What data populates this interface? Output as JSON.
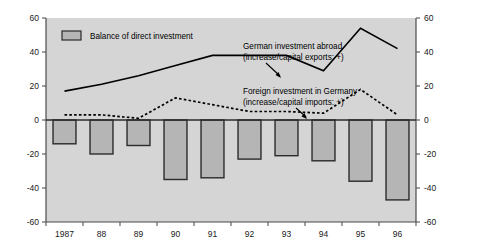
{
  "chart_data": {
    "type": "bar",
    "title": "",
    "subtitle": "",
    "xlabel": "",
    "ylabel": "",
    "ylim": [
      -60,
      60
    ],
    "y_ticks": [
      60,
      40,
      20,
      0,
      -20,
      -40,
      -60
    ],
    "y_tick_labels": [
      "60",
      "40",
      "20",
      "0",
      "-20",
      "-40",
      "-60"
    ],
    "right_axis": true,
    "right_y_tick_labels": [
      "60",
      "40",
      "20",
      "0",
      "-20",
      "-40",
      "-60"
    ],
    "grid": false,
    "legend_position": "inside-top-left",
    "categories": [
      "1987",
      "88",
      "89",
      "90",
      "91",
      "92",
      "93",
      "94",
      "95",
      "96"
    ],
    "series": [
      {
        "name": "Balance of direct investment",
        "type": "bar",
        "values": [
          -14,
          -20,
          -15,
          -35,
          -34,
          -23,
          -21,
          -24,
          -36,
          -47
        ]
      },
      {
        "name": "German investment abroad (increase/capital exports: +)",
        "type": "line",
        "style": "solid",
        "values": [
          17,
          21,
          26,
          32,
          38,
          38,
          38,
          29,
          54,
          42
        ]
      },
      {
        "name": "Foreign investment in Germany (increase/capital imports: +)",
        "type": "line",
        "style": "dashed",
        "values": [
          3,
          3,
          1,
          13,
          9,
          5,
          5,
          4,
          18,
          3
        ]
      }
    ]
  },
  "legend": {
    "items": [
      {
        "label": "Balance of direct investment",
        "swatch": "#b5b5b5"
      }
    ]
  },
  "annotations": [
    {
      "name": "german-investment-abroad",
      "line1": "German investment abroad",
      "line2": "(increase/capital exports: +)"
    },
    {
      "name": "foreign-investment-in-germany",
      "line1": "Foreign investment in Germany",
      "line2": "(increase/capital imports: +)"
    }
  ],
  "colors": {
    "plot_background": "#d5d5d5",
    "bar_fill": "#b5b5b5",
    "bar_stroke": "#2b2b2b",
    "line": "#000000",
    "axis": "#555555",
    "text": "#1a1a1a",
    "page_background": "#ffffff"
  }
}
